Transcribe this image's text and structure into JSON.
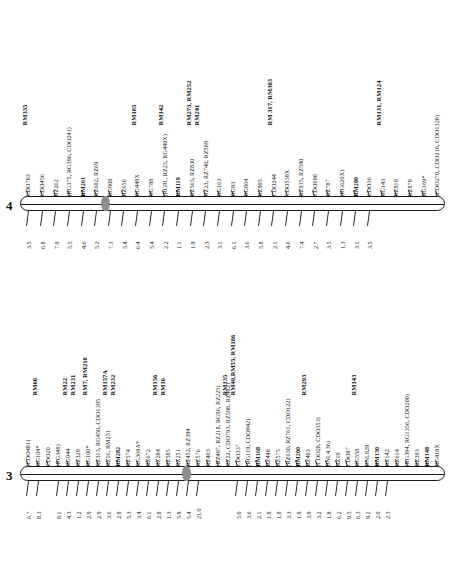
{
  "figure": {
    "type": "genetic-linkage-map"
  },
  "chromosomes": [
    {
      "id": "chr4",
      "name": "4",
      "centromere_index": 5,
      "loci": [
        {
          "label": "CDO783",
          "bold": false,
          "dist": "3.5"
        },
        {
          "label": "CDO456",
          "bold": false,
          "dist": "6.8"
        },
        {
          "label": "RZ262",
          "bold": false,
          "dist": "7.9"
        },
        {
          "label": "(RG375, RG396, CDO241)",
          "bold": false,
          "dist": "5.5"
        },
        {
          "label": "RM261",
          "bold": true,
          "dist": "4.6"
        },
        {
          "label": "RZ602, RZ69",
          "bold": false,
          "dist": "5.2"
        },
        {
          "label": "RG908",
          "bold": false,
          "dist": "7.3"
        },
        {
          "label": "RZ656",
          "bold": false,
          "dist": "5.4"
        },
        {
          "label": "RG449X",
          "bold": false,
          "dist": "6.4"
        },
        {
          "label": "RG788",
          "bold": false,
          "dist": "5.4"
        },
        {
          "label": "(RG91, RZ23, RG449X)",
          "bold": false,
          "dist": "2.2"
        },
        {
          "label": "RM119",
          "bold": true,
          "dist": "1.1"
        },
        {
          "label": "RZ565, RZ830",
          "bold": false,
          "dist": "1.9"
        },
        {
          "label": "RZ23, RZ740, RZ589",
          "bold": false,
          "dist": "2.3"
        },
        {
          "label": "RG163",
          "bold": false,
          "dist": "3.1"
        },
        {
          "label": "RG93",
          "bold": false,
          "dist": "6.1"
        },
        {
          "label": "RG864",
          "bold": false,
          "dist": "3.6"
        },
        {
          "label": "RZ905",
          "bold": false,
          "dist": "5.8"
        },
        {
          "label": "CDO244",
          "bold": false,
          "dist": "2.1"
        },
        {
          "label": "CDO539X",
          "bold": false,
          "dist": "4.6"
        },
        {
          "label": "RZ935, RZ590",
          "bold": false,
          "dist": "7.4"
        },
        {
          "label": "CDO690",
          "bold": false,
          "dist": "2.7"
        },
        {
          "label": "RZ787",
          "bold": false,
          "dist": "3.5"
        },
        {
          "label": "(RG620X)",
          "bold": false,
          "dist": "1.3"
        },
        {
          "label": "RM280",
          "bold": true,
          "dist": "3.1"
        },
        {
          "label": "CDO36",
          "bold": false,
          "dist": "3.5"
        },
        {
          "label": "RG143",
          "bold": false,
          "dist": ""
        },
        {
          "label": "RZ819",
          "bold": false,
          "dist": ""
        },
        {
          "label": "RZ879",
          "bold": false,
          "dist": ""
        },
        {
          "label": "RG169*",
          "bold": false,
          "dist": ""
        },
        {
          "label": "(CDO270, CDO216, CDO1328)",
          "bold": false,
          "dist": ""
        }
      ],
      "rm_groups": [
        {
          "lines": [
            "RM335"
          ],
          "anchor": 0
        },
        {
          "lines": [
            "RM185"
          ],
          "anchor": 8
        },
        {
          "lines": [
            "RM142"
          ],
          "anchor": 10
        },
        {
          "lines": [
            "RM273, RM252",
            "RM241"
          ],
          "anchor": 12
        },
        {
          "lines": [
            "RM 317, RM303"
          ],
          "anchor": 18
        },
        {
          "lines": [
            "RM131, RM124"
          ],
          "anchor": 26
        }
      ]
    },
    {
      "id": "chr3",
      "name": "3",
      "centromere_index": 15,
      "loci": [
        {
          "label": "(CDO481)",
          "bold": false,
          "dist": "6.7"
        },
        {
          "label": "RG104*",
          "bold": false,
          "dist": "8.3"
        },
        {
          "label": "CDO20",
          "bold": false,
          "dist": ""
        },
        {
          "label": "(RG348)",
          "bold": false,
          "dist": "8.1"
        },
        {
          "label": "RG944",
          "bold": false,
          "dist": "4.3"
        },
        {
          "label": "RZ329",
          "bold": false,
          "dist": "1.2"
        },
        {
          "label": "RG100*",
          "bold": false,
          "dist": "2.9"
        },
        {
          "label": "RZ313, RG450, CDO1395",
          "bold": false,
          "dist": "2.9"
        },
        {
          "label": "RZ16, RM251",
          "bold": false,
          "dist": "3.6"
        },
        {
          "label": "RM282",
          "bold": true,
          "dist": "2.8"
        },
        {
          "label": "RZ574",
          "bold": false,
          "dist": "5.3"
        },
        {
          "label": "RG369A*",
          "bold": false,
          "dist": "3.4"
        },
        {
          "label": "RZ672",
          "bold": false,
          "dist": "6.1"
        },
        {
          "label": "RZ284",
          "bold": false,
          "dist": "2.8"
        },
        {
          "label": "RZ585",
          "bold": false,
          "dist": "1.3"
        },
        {
          "label": "RZ251",
          "bold": false,
          "dist": "5.8"
        },
        {
          "label": "RZ452, RZ394",
          "bold": false,
          "dist": "5.4"
        },
        {
          "label": "RZ576",
          "bold": false,
          "dist": "21.0"
        },
        {
          "label": "RZ403",
          "bold": false,
          "dist": ""
        },
        {
          "label": "(RZ497, RZ218, RG96, RZ225)",
          "bold": false,
          "dist": ""
        },
        {
          "label": "RZ22, CDO793, RZ598, RZ482)",
          "bold": false,
          "dist": ""
        },
        {
          "label": "CDO337",
          "bold": false,
          "dist": "5.0"
        },
        {
          "label": "(RG119, CDO942)",
          "bold": false,
          "dist": "3.6"
        },
        {
          "label": "RM168",
          "bold": true,
          "dist": "2.1"
        },
        {
          "label": "RZ448",
          "bold": false,
          "dist": "1.8"
        },
        {
          "label": "RZ575",
          "bold": false,
          "dist": "1.8"
        },
        {
          "label": "(RZ630, RZ761, CDO122)",
          "bold": false,
          "dist": "3.3"
        },
        {
          "label": "RM200",
          "bold": true,
          "dist": "1.8"
        },
        {
          "label": "RZ403",
          "bold": false,
          "dist": "3.9"
        },
        {
          "label": "(CDO28, CDO353)",
          "bold": false,
          "dist": "3.2"
        },
        {
          "label": "BNL4.36)",
          "bold": false,
          "dist": "1.8"
        },
        {
          "label": "RZ19",
          "bold": false,
          "dist": "6.2"
        },
        {
          "label": "CDO87",
          "bold": false,
          "dist": "9.5"
        },
        {
          "label": "RG558",
          "bold": false,
          "dist": "6.3"
        },
        {
          "label": "BNL829",
          "bold": false,
          "dist": "9.2"
        },
        {
          "label": "RM130",
          "bold": true,
          "dist": "2.0"
        },
        {
          "label": "RZ142",
          "bold": false,
          "dist": "2.3"
        },
        {
          "label": "RZ614",
          "bold": false,
          "dist": ""
        },
        {
          "label": "(RG394, RG1356, CDO200)",
          "bold": false,
          "dist": ""
        },
        {
          "label": "RZ393",
          "bold": false,
          "dist": ""
        },
        {
          "label": "RM148",
          "bold": true,
          "dist": ""
        },
        {
          "label": "RG418X",
          "bold": false,
          "dist": ""
        }
      ],
      "rm_groups": [
        {
          "lines": [
            "RM60"
          ],
          "anchor": 1
        },
        {
          "lines": [
            "RM22",
            "RM231"
          ],
          "anchor": 4
        },
        {
          "lines": [
            "RM7, RM218"
          ],
          "anchor": 6
        },
        {
          "lines": [
            "RM157A",
            "RM232"
          ],
          "anchor": 8
        },
        {
          "lines": [
            "RM156",
            "RM16"
          ],
          "anchor": 13
        },
        {
          "lines": [
            "RM135",
            "RM49,RM55, RM186"
          ],
          "anchor": 20
        },
        {
          "lines": [
            "RM293"
          ],
          "anchor": 28
        },
        {
          "lines": [
            "RM143"
          ],
          "anchor": 33
        }
      ]
    }
  ]
}
